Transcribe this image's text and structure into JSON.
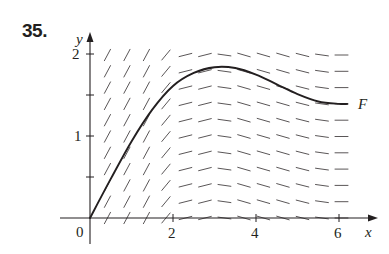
{
  "problem": {
    "number": "35."
  },
  "chart_data": {
    "type": "line",
    "title": "",
    "xlabel": "x",
    "ylabel": "y",
    "x_ticks": [
      "0",
      "2",
      "4",
      "6"
    ],
    "y_ticks": [
      "1",
      "2"
    ],
    "origin_label": "0",
    "xlim": [
      0,
      6.8
    ],
    "ylim": [
      0,
      2.2
    ],
    "grid": false,
    "slope_field": {
      "x_start": 0.42,
      "x_step": 0.47,
      "columns": 13,
      "y_start": 0.0,
      "y_step": 0.2,
      "rows": 11,
      "description": "Steep positive slopes for x < ~2, flattening near x ≈ 2.5, slightly negative slopes for 3 < x < 5.5, near zero at x ≈ 6"
    },
    "series": [
      {
        "name": "F",
        "label": "F",
        "x": [
          0,
          0.5,
          1.0,
          1.5,
          2.0,
          2.5,
          3.0,
          3.5,
          4.0,
          4.5,
          5.0,
          5.5,
          6.0,
          6.2
        ],
        "y": [
          0,
          0.48,
          0.94,
          1.33,
          1.62,
          1.78,
          1.85,
          1.84,
          1.76,
          1.64,
          1.52,
          1.43,
          1.4,
          1.4
        ]
      }
    ]
  }
}
